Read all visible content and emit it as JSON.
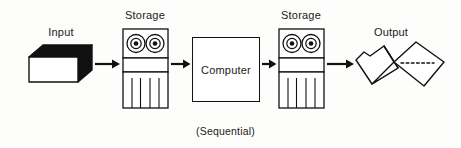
{
  "diagram": {
    "title": "",
    "caption": "(Sequential)",
    "stroke_color": "#111111",
    "fill_color": "#ffffff",
    "accent_color": "#000000",
    "background_color": "#fdfdfb",
    "nodes": [
      {
        "id": "input",
        "label": "Input",
        "icon": "card-deck-icon",
        "shape": "3d-box",
        "x": 30,
        "y": 47,
        "width": 62,
        "height": 34
      },
      {
        "id": "storage-1",
        "label": "Storage",
        "icon": "magnetic-tape-icon",
        "shape": "tape-drive",
        "x": 122,
        "y": 28,
        "width": 46,
        "height": 80,
        "reels": 2,
        "slots": 5
      },
      {
        "id": "computer",
        "label": "Computer",
        "icon": "process-box-icon",
        "shape": "rectangle",
        "x": 192,
        "y": 37,
        "width": 68,
        "height": 65
      },
      {
        "id": "storage-2",
        "label": "Storage",
        "icon": "magnetic-tape-icon",
        "shape": "tape-drive",
        "x": 278,
        "y": 28,
        "width": 46,
        "height": 80,
        "reels": 2,
        "slots": 5
      },
      {
        "id": "output",
        "label": "Output",
        "icon": "fanfold-paper-icon",
        "shape": "continuous-forms",
        "x": 356,
        "y": 44,
        "width": 88,
        "height": 48
      }
    ],
    "arrows": [
      {
        "id": "arrow-input-storage1",
        "from": "input",
        "to": "storage-1",
        "x": 94,
        "y": 64,
        "length": 26
      },
      {
        "id": "arrow-storage1-computer",
        "from": "storage-1",
        "to": "computer",
        "x": 170,
        "y": 64,
        "length": 20
      },
      {
        "id": "arrow-computer-storage2",
        "from": "computer",
        "to": "storage-2",
        "x": 262,
        "y": 64,
        "length": 14
      },
      {
        "id": "arrow-storage2-output",
        "from": "storage-2",
        "to": "output",
        "x": 326,
        "y": 64,
        "length": 28
      }
    ],
    "labels": [
      {
        "id": "label-input",
        "text": "Input",
        "x": 32,
        "y": 26,
        "width": 58
      },
      {
        "id": "label-storage1",
        "text": "Storage",
        "x": 116,
        "y": 9,
        "width": 58
      },
      {
        "id": "label-computer",
        "text": "Computer",
        "x": 192,
        "y": 62,
        "width": 68
      },
      {
        "id": "label-storage2",
        "text": "Storage",
        "x": 272,
        "y": 9,
        "width": 58
      },
      {
        "id": "label-output",
        "text": "Output",
        "x": 362,
        "y": 26,
        "width": 58
      }
    ]
  }
}
